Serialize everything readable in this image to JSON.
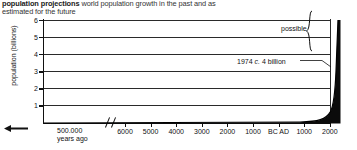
{
  "caption": {
    "bold": "population projections",
    "rest": " world population growth in the past and as estimated for the future"
  },
  "chart_data": {
    "type": "line",
    "title": "population projections",
    "subtitle": "world population growth in the past and as estimated for the future",
    "xlabel": "",
    "ylabel": "population (billions)",
    "ylim": [
      0,
      6
    ],
    "yticks": [
      "1",
      "2",
      "3",
      "4",
      "5",
      "6"
    ],
    "grid": true,
    "legend": "none",
    "axis_break": true,
    "x_left_label_line1": "500.000",
    "x_left_label_line2": "years ago",
    "xticks": [
      "6000",
      "5000",
      "4000",
      "3000",
      "2000",
      "1000",
      "BC AD",
      "1000",
      "2000"
    ],
    "annotations": [
      {
        "name": "possible",
        "text": "possible"
      },
      {
        "name": "1974-marker",
        "text": "1974 c. 4 billion",
        "value": 4,
        "year": 1974
      }
    ],
    "series": [
      {
        "name": "world population",
        "points": [
          {
            "x": "500000 years ago",
            "y": 0.0
          },
          {
            "x": "6000 BC",
            "y": 0.01
          },
          {
            "x": "1000 BC",
            "y": 0.05
          },
          {
            "x": "AD 1",
            "y": 0.2
          },
          {
            "x": "AD 1000",
            "y": 0.3
          },
          {
            "x": "AD 1750",
            "y": 0.8
          },
          {
            "x": "AD 1900",
            "y": 1.6
          },
          {
            "x": "AD 1974",
            "y": 4.0
          },
          {
            "x": "AD 2000",
            "y": 6.0
          }
        ]
      }
    ]
  },
  "axis": {
    "y_title": "population (billions)",
    "y_labels": [
      "6",
      "5",
      "4",
      "3",
      "2",
      "1"
    ],
    "x_labels": [
      "6000",
      "5000",
      "4000",
      "3000",
      "2000",
      "1000",
      "BC AD",
      "1000",
      "2000"
    ],
    "x_left_line1": "500.000",
    "x_left_line2": "years ago"
  },
  "annotations": {
    "possible": "possible",
    "marker_1974_pre": "1974 ",
    "marker_1974_italic": "c.",
    "marker_1974_post": " 4 billion"
  },
  "icons": {
    "left_arrow": "left-arrow-icon",
    "brace": "curly-brace-icon"
  }
}
